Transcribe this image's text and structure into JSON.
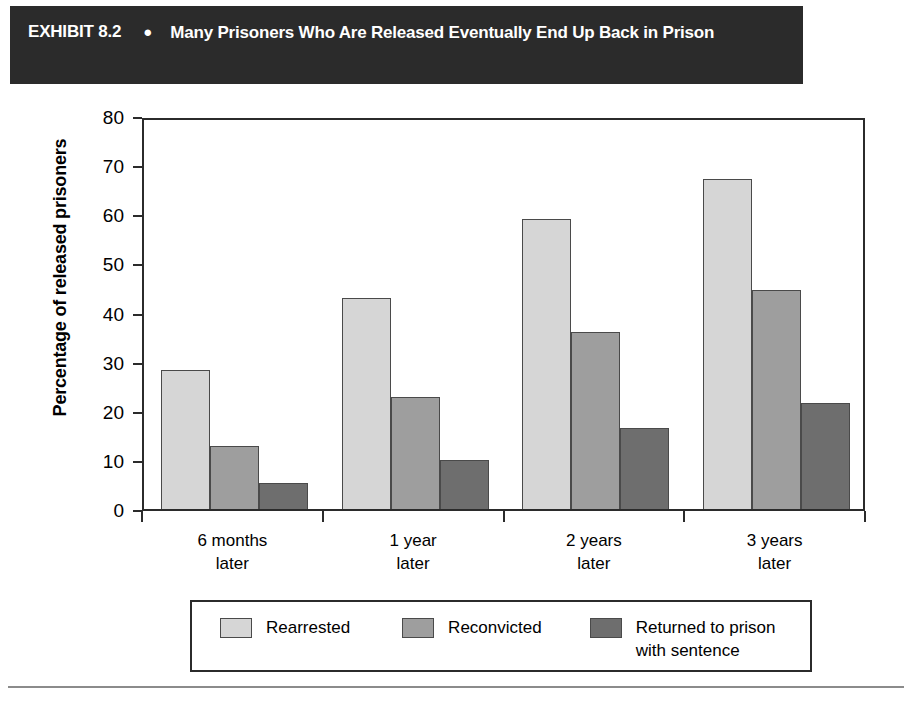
{
  "exhibit": {
    "label": "EXHIBIT 8.2",
    "bullet": "●",
    "title": "Many Prisoners Who Are Released Eventually End Up Back in Prison"
  },
  "chart_data": {
    "type": "bar",
    "title": "Many Prisoners Who Are Released Eventually End Up Back in Prison",
    "xlabel": "",
    "ylabel": "Percentage of released prisoners",
    "ylim": [
      0,
      80
    ],
    "yticks": [
      0,
      10,
      20,
      30,
      40,
      50,
      60,
      70,
      80
    ],
    "grid": false,
    "legend_position": "bottom",
    "categories": [
      "6 months\nlater",
      "1 year\nlater",
      "2 years\nlater",
      "3 years\nlater"
    ],
    "series": [
      {
        "name": "Rearrested",
        "color": "#d6d6d6",
        "values": [
          28.2,
          43.0,
          59.0,
          67.2
        ]
      },
      {
        "name": "Reconvicted",
        "color": "#9e9e9e",
        "values": [
          12.9,
          22.8,
          36.0,
          44.5
        ]
      },
      {
        "name": "Returned to prison\nwith sentence",
        "color": "#6e6e6e",
        "values": [
          5.2,
          10.0,
          16.4,
          21.6
        ]
      }
    ]
  },
  "colors": {
    "header_background": "#2b2b2b",
    "header_text": "#ffffff",
    "axis": "#2b2b2b",
    "series1": "#d6d6d6",
    "series2": "#9e9e9e",
    "series3": "#6e6e6e",
    "page_background": "#ffffff",
    "rule": "#8b8b8b"
  }
}
